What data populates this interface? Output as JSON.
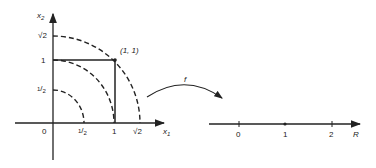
{
  "left_plot": {
    "x_axis_label": "x",
    "x_axis_sub": "1",
    "y_axis_label": "x",
    "y_axis_sub": "2",
    "origin_label": "0",
    "x_ticks": [
      {
        "label_num": "1",
        "label_den": "2",
        "value": 0.5
      },
      {
        "label": "1",
        "value": 1
      },
      {
        "label": "√2",
        "value": 1.4142
      }
    ],
    "y_ticks": [
      {
        "label_num": "1",
        "label_den": "2",
        "value": 0.5
      },
      {
        "label": "1",
        "value": 1
      },
      {
        "label": "√2",
        "value": 1.4142
      }
    ],
    "point_label": "(1, 1)",
    "arcs": [
      "radius 1/2 (dashed)",
      "radius 1 (dashed)",
      "radius √2 (dashed)"
    ],
    "square": "unit square [0,1]×[0,1]"
  },
  "mapping": {
    "label": "f"
  },
  "right_line": {
    "ticks": [
      "0",
      "1",
      "2"
    ],
    "axis_label": "R"
  }
}
